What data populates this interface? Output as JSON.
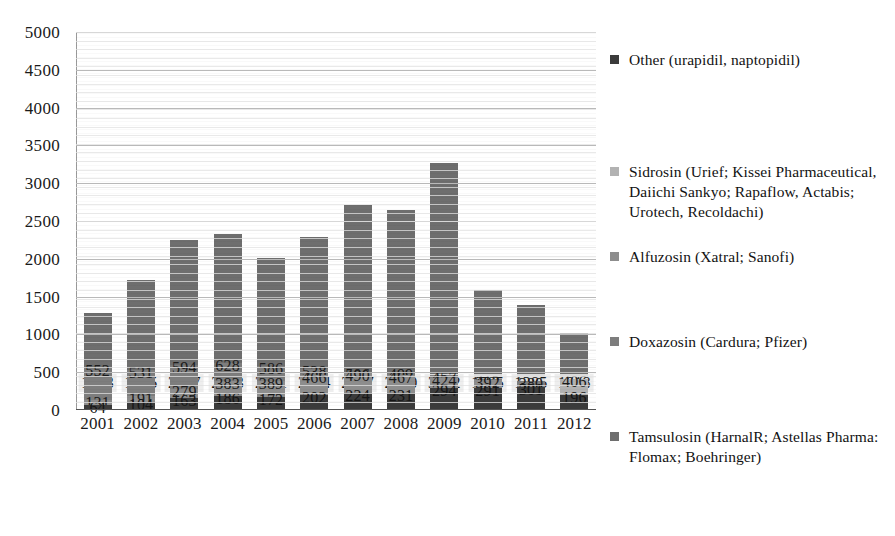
{
  "chart_data": {
    "type": "bar",
    "subtype": "stacked-bar",
    "title": "",
    "subtitle": "",
    "xlabel": "",
    "ylabel": "",
    "ylim": [
      0,
      5000
    ],
    "ytick_step": 500,
    "grid": true,
    "legend_position": "right",
    "categories": [
      "2001",
      "2002",
      "2003",
      "2004",
      "2005",
      "2006",
      "2007",
      "2008",
      "2009",
      "2010",
      "2011",
      "2012"
    ],
    "ytick_labels": [
      "0",
      "500",
      "1000",
      "1500",
      "2000",
      "2500",
      "3000",
      "3500",
      "4000",
      "4500",
      "5000"
    ],
    "series": [
      {
        "name": "Tamsulosin (HarnalR; Astellas Pharma: Flomax; Boehringer)",
        "color": "#6e6e6e",
        "label_color": "#1b1b1b",
        "values": [
          1283,
          1725,
          2247,
          2323,
          2011,
          2284,
          2707,
          2650,
          3262,
          1585,
          1385,
          1018
        ]
      },
      {
        "name": "Doxazosin (Cardura; Pfizer)",
        "color": "#7d7d7d",
        "label_color": "#1b1b1b",
        "values": [
          552,
          531,
          594,
          628,
          586,
          538,
          506,
          499,
          457,
          413,
          380,
          338
        ]
      },
      {
        "name": "Alfuzosin (Xatral; Sanofi)",
        "color": "#8d8d8d",
        "label_color": "#1b1b1b",
        "values": [
          131,
          191,
          279,
          383,
          389,
          466,
          490,
          467,
          424,
          392,
          259,
          172
        ]
      },
      {
        "name": "Sidrosin (Urief; Kissei Pharmaceutical, Daiichi Sankyo; Rapaflow, Actabis; Urotech, Recoldachi)",
        "color": "#b2b2b2",
        "label_color": "#1b1b1b",
        "values": [
          0,
          0,
          0,
          0,
          0,
          0,
          0,
          0,
          0,
          204,
          308,
          406
        ]
      },
      {
        "name": "Other (urapidil, naptopidil)",
        "color": "#3b3b3b",
        "label_color": "#1b1b1b",
        "values": [
          64,
          104,
          163,
          186,
          172,
          202,
          224,
          231,
          294,
          291,
          301,
          196
        ]
      }
    ],
    "totals": [
      2030,
      2551,
      3283,
      3520,
      3158,
      3490,
      3927,
      3847,
      4437,
      2885,
      2633,
      2130
    ]
  },
  "legend": {
    "items": [
      {
        "label": "Other (urapidil, naptopidil)",
        "color": "#3b3b3b"
      },
      {
        "label": "Sidrosin (Urief; Kissei Pharmaceutical, Daiichi Sankyo; Rapaflow, Actabis; Urotech, Recoldachi)",
        "color": "#b2b2b2"
      },
      {
        "label": "Alfuzosin (Xatral; Sanofi)",
        "color": "#8d8d8d"
      },
      {
        "label": "Doxazosin (Cardura; Pfizer)",
        "color": "#7d7d7d"
      },
      {
        "label": "Tamsulosin (HarnalR; Astellas Pharma: Flomax; Boehringer)",
        "color": "#6e6e6e"
      }
    ]
  }
}
